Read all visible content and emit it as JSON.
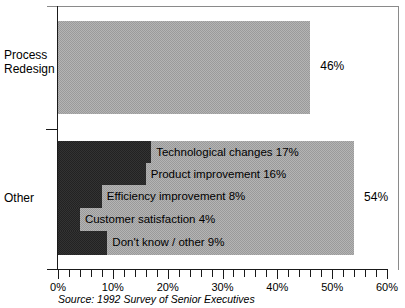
{
  "chart_data": {
    "type": "bar",
    "orientation": "horizontal",
    "title": "",
    "xlabel": "",
    "ylabel": "",
    "xlim": [
      0,
      60
    ],
    "grid": false,
    "legend": null,
    "categories": [
      "Process Redesign",
      "Other"
    ],
    "values": [
      46,
      54
    ],
    "value_labels": [
      "46%",
      "54%"
    ],
    "category_lines": [
      [
        "Process",
        "Redesign"
      ],
      [
        "Other"
      ]
    ],
    "tick_labels": [
      "0%",
      "10%",
      "20%",
      "30%",
      "40%",
      "50%",
      "60%"
    ],
    "tick_values": [
      0,
      10,
      20,
      30,
      40,
      50,
      60
    ],
    "minor_tick_step": 2,
    "segments": [
      {
        "label": "Technological changes 17%",
        "name": "Technological changes",
        "value": 17
      },
      {
        "label": "Product improvement 16%",
        "name": "Product improvement",
        "value": 16
      },
      {
        "label": "Efficiency improvement 8%",
        "name": "Efficiency improvement",
        "value": 8
      },
      {
        "label": "Customer satisfaction 4%",
        "name": "Customer satisfaction",
        "value": 4
      },
      {
        "label": "Don't know / other 9%",
        "name": "Don't know / other",
        "value": 9
      }
    ],
    "source": "Source: 1992 Survey of Senior Executives",
    "colors": {
      "bar_light": "#b4b4b4",
      "bar_dark": "#333333",
      "axis": "#1a1a1a",
      "frame": "#8a8a8a",
      "text": "#000000"
    }
  }
}
